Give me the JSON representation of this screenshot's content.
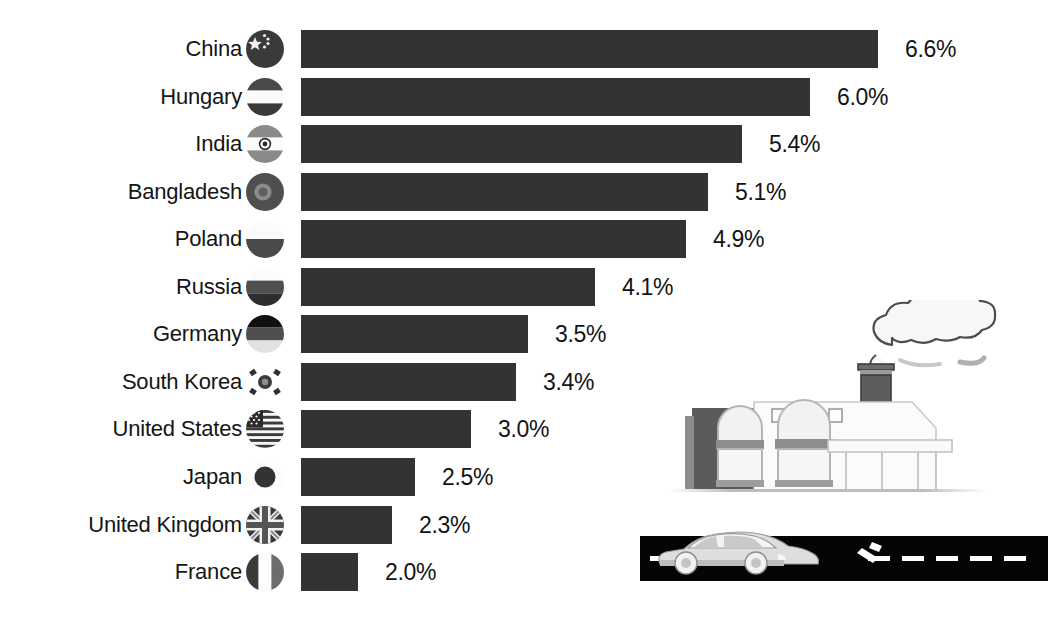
{
  "chart_data": {
    "type": "bar",
    "orientation": "horizontal",
    "title": "",
    "subtitle": "",
    "xlabel": "",
    "ylabel": "",
    "grid": false,
    "legend": null,
    "value_suffix": "%",
    "xlim": [
      0,
      6.6
    ],
    "categories": [
      "China",
      "Hungary",
      "India",
      "Bangladesh",
      "Poland",
      "Russia",
      "Germany",
      "South Korea",
      "United States",
      "Japan",
      "United Kingdom",
      "France"
    ],
    "values": [
      6.6,
      6.0,
      5.4,
      5.1,
      4.9,
      4.1,
      3.5,
      3.4,
      3.0,
      2.5,
      2.3,
      2.0
    ],
    "value_labels": [
      "6.6%",
      "6.0%",
      "5.4%",
      "5.1%",
      "4.9%",
      "4.1%",
      "3.5%",
      "3.4%",
      "3.0%",
      "2.5%",
      "2.3%",
      "2.0%"
    ],
    "bar_color": "#333333",
    "background_color": "#ffffff",
    "text_color": "#151515"
  },
  "rows": [
    {
      "country": "China",
      "value_label": "6.6%",
      "flag": "flag-china-icon"
    },
    {
      "country": "Hungary",
      "value_label": "6.0%",
      "flag": "flag-hungary-icon"
    },
    {
      "country": "India",
      "value_label": "5.4%",
      "flag": "flag-india-icon"
    },
    {
      "country": "Bangladesh",
      "value_label": "5.1%",
      "flag": "flag-bangladesh-icon"
    },
    {
      "country": "Poland",
      "value_label": "4.9%",
      "flag": "flag-poland-icon"
    },
    {
      "country": "Russia",
      "value_label": "4.1%",
      "flag": "flag-russia-icon"
    },
    {
      "country": "Germany",
      "value_label": "3.5%",
      "flag": "flag-germany-icon"
    },
    {
      "country": "South Korea",
      "value_label": "3.4%",
      "flag": "flag-south-korea-icon"
    },
    {
      "country": "United States",
      "value_label": "3.0%",
      "flag": "flag-united-states-icon"
    },
    {
      "country": "Japan",
      "value_label": "2.5%",
      "flag": "flag-japan-icon"
    },
    {
      "country": "United Kingdom",
      "value_label": "2.3%",
      "flag": "flag-united-kingdom-icon"
    },
    {
      "country": "France",
      "value_label": "2.0%",
      "flag": "flag-france-icon"
    }
  ],
  "illustrations": {
    "factory": "factory-with-smokestack-illustration",
    "road": "car-on-road-illustration"
  }
}
